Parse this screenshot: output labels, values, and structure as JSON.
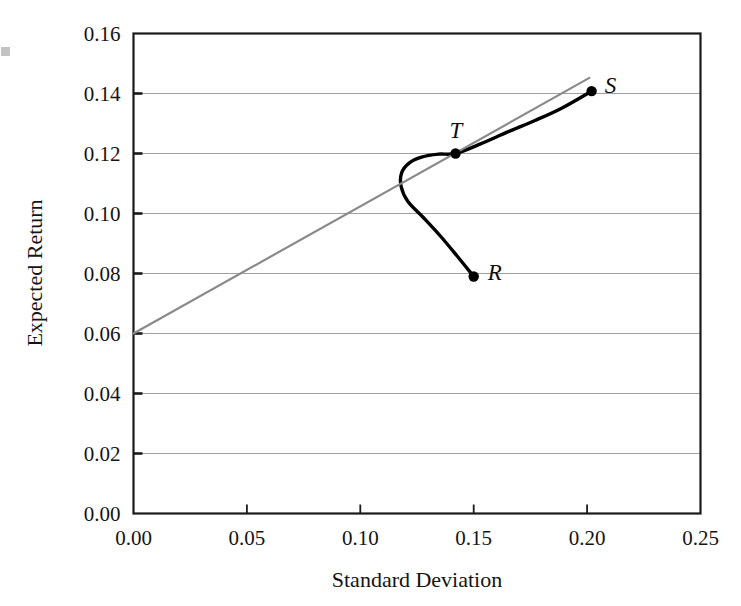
{
  "chart_data": {
    "type": "line",
    "title": "",
    "xlabel": "Standard Deviation",
    "ylabel": "Expected Return",
    "xlim": [
      0.0,
      0.25
    ],
    "ylim": [
      0.0,
      0.16
    ],
    "xticks": [
      "0.00",
      "0.05",
      "0.10",
      "0.15",
      "0.20",
      "0.25"
    ],
    "xtick_values": [
      0.0,
      0.05,
      0.1,
      0.15,
      0.2,
      0.25
    ],
    "yticks": [
      "0.00",
      "0.02",
      "0.04",
      "0.06",
      "0.08",
      "0.10",
      "0.12",
      "0.14",
      "0.16"
    ],
    "ytick_values": [
      0.0,
      0.02,
      0.04,
      0.06,
      0.08,
      0.1,
      0.12,
      0.14,
      0.16
    ],
    "grid": "horizontal",
    "legend": "none",
    "series": [
      {
        "name": "efficient-frontier-curve",
        "type": "curve",
        "color": "#000000",
        "width": 3.4,
        "points": [
          [
            0.15,
            0.079
          ],
          [
            0.1425,
            0.086
          ],
          [
            0.1353,
            0.0925
          ],
          [
            0.128,
            0.0985
          ],
          [
            0.121,
            0.104
          ],
          [
            0.118,
            0.109
          ],
          [
            0.1182,
            0.1135
          ],
          [
            0.1215,
            0.1168
          ],
          [
            0.127,
            0.1188
          ],
          [
            0.1345,
            0.1198
          ],
          [
            0.142,
            0.12
          ],
          [
            0.153,
            0.1232
          ],
          [
            0.165,
            0.1272
          ],
          [
            0.177,
            0.131
          ],
          [
            0.189,
            0.1352
          ],
          [
            0.202,
            0.1408
          ]
        ]
      },
      {
        "name": "capital-market-line",
        "type": "line",
        "color": "#8a8a8a",
        "width": 2.2,
        "points": [
          [
            0.0,
            0.06
          ],
          [
            0.201,
            0.1452
          ]
        ]
      }
    ],
    "annotations": [
      {
        "label": "R",
        "x": 0.15,
        "y": 0.079,
        "marker": "dot",
        "label_dx": 14,
        "label_dy": 3
      },
      {
        "label": "T",
        "x": 0.142,
        "y": 0.12,
        "marker": "dot",
        "label_dx": -6,
        "label_dy": -16
      },
      {
        "label": "S",
        "x": 0.202,
        "y": 0.1408,
        "marker": "dot",
        "label_dx": 13,
        "label_dy": 2
      }
    ],
    "colors": {
      "frontier": "#000000",
      "cml": "#8a8a8a",
      "grid": "#a0a0a0",
      "frame": "#1a1a1a",
      "text": "#141414"
    }
  }
}
